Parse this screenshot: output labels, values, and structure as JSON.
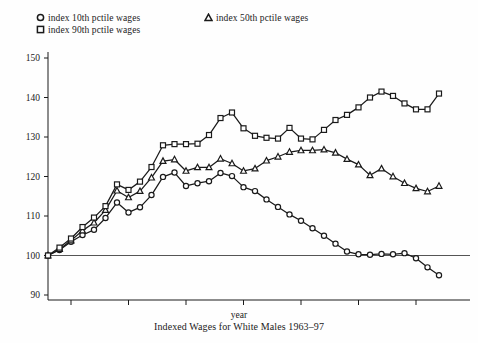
{
  "legend": {
    "items": [
      {
        "key": "p10",
        "marker": "circle-marker",
        "label": "index 10th pctile wages"
      },
      {
        "key": "p90",
        "marker": "square-marker",
        "label": "index 90th pctile wages"
      },
      {
        "key": "p50",
        "marker": "triangle-marker",
        "label": "index 50th pctile wages"
      }
    ]
  },
  "axes": {
    "y_ticks": [
      "150",
      "140",
      "130",
      "120",
      "110",
      "100",
      "90"
    ],
    "x_ticks": [
      "65",
      "70",
      "75",
      "80",
      "85",
      "90",
      "95"
    ],
    "x_title": "year"
  },
  "caption": "Indexed Wages for White Males 1963–97",
  "colors": {
    "ink": "#1a1a1a",
    "reference_line": "#555555",
    "marker_fill": "#ffffff"
  },
  "chart_data": {
    "type": "line",
    "title": "Indexed Wages for White Males 1963–97",
    "xlabel": "year",
    "ylabel": "",
    "xlim": [
      1963,
      1997
    ],
    "ylim": [
      88,
      152
    ],
    "grid": false,
    "legend_position": "above-plot",
    "reference_line_y": 100,
    "x": [
      1963,
      1964,
      1965,
      1966,
      1967,
      1968,
      1969,
      1970,
      1971,
      1972,
      1973,
      1974,
      1975,
      1976,
      1977,
      1978,
      1979,
      1980,
      1981,
      1982,
      1983,
      1984,
      1985,
      1986,
      1987,
      1988,
      1989,
      1990,
      1991,
      1992,
      1993,
      1994,
      1995,
      1996,
      1997
    ],
    "series": [
      {
        "name": "index 10th pctile wages",
        "marker": "circle-marker",
        "values": [
          100.0,
          101.4,
          103.5,
          105.2,
          106.5,
          109.5,
          113.4,
          110.9,
          112.2,
          115.3,
          119.9,
          121.0,
          117.6,
          118.3,
          118.8,
          120.9,
          120.1,
          117.3,
          116.3,
          114.2,
          112.3,
          110.4,
          108.8,
          106.9,
          105.0,
          103.0,
          101.0,
          100.3,
          100.2,
          100.4,
          100.3,
          100.6,
          99.3,
          97.0,
          95.0
        ]
      },
      {
        "name": "index 50th pctile wages",
        "marker": "triangle-marker",
        "values": [
          100.0,
          101.6,
          103.8,
          106.3,
          108.3,
          111.5,
          116.4,
          114.7,
          116.3,
          119.7,
          123.9,
          124.3,
          121.4,
          122.3,
          122.3,
          124.5,
          123.3,
          121.4,
          122.0,
          124.0,
          125.0,
          126.2,
          126.6,
          126.6,
          126.8,
          126.0,
          124.4,
          123.0,
          120.3,
          122.0,
          120.0,
          118.3,
          117.0,
          116.2,
          117.6
        ]
      },
      {
        "name": "index 90th pctile wages",
        "marker": "square-marker",
        "values": [
          100.0,
          102.0,
          104.3,
          107.2,
          109.6,
          112.5,
          118.0,
          116.6,
          118.7,
          122.4,
          127.9,
          128.2,
          128.2,
          128.3,
          130.5,
          134.8,
          136.2,
          132.2,
          130.3,
          129.8,
          129.6,
          132.3,
          129.6,
          129.4,
          131.8,
          134.3,
          135.6,
          137.5,
          140.0,
          141.5,
          140.4,
          138.5,
          137.0,
          137.0,
          141.0
        ]
      }
    ]
  }
}
